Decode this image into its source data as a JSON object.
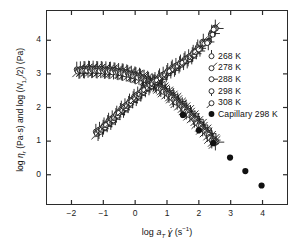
{
  "chart_data": {
    "type": "scatter",
    "title": "",
    "xlabel": "log a_T γ̇ (s⁻¹)",
    "ylabel": "log η_r (Pa·s) and log (N_1,r /2) (Pa)",
    "xlim": [
      -2.8,
      4.8
    ],
    "ylim": [
      -0.9,
      4.9
    ],
    "xticks": [
      -2,
      -1,
      0,
      1,
      2,
      3,
      4
    ],
    "yticks": [
      0,
      1,
      2,
      3,
      4
    ],
    "grid": false,
    "legend_position": "right-inside",
    "legend": [
      {
        "label": "268 K",
        "marker": "circle-tick-up",
        "filled": false
      },
      {
        "label": "278 K",
        "marker": "circle-tick-upright",
        "filled": false
      },
      {
        "label": "288 K",
        "marker": "circle-tick-right",
        "filled": false
      },
      {
        "label": "298 K",
        "marker": "circle-tick-down",
        "filled": false
      },
      {
        "label": "308 K",
        "marker": "circle-tick-downleft",
        "filled": false
      },
      {
        "label": "Capillary 298 K",
        "marker": "filled-circle",
        "filled": true
      }
    ],
    "series": [
      {
        "name": "log η_r (viscosity master curve)",
        "marker": "open-circle-with-tick",
        "points": [
          [
            -1.8,
            3.1
          ],
          [
            -1.72,
            3.11
          ],
          [
            -1.64,
            3.12
          ],
          [
            -1.56,
            3.11
          ],
          [
            -1.48,
            3.13
          ],
          [
            -1.4,
            3.12
          ],
          [
            -1.32,
            3.13
          ],
          [
            -1.24,
            3.12
          ],
          [
            -1.16,
            3.11
          ],
          [
            -1.08,
            3.12
          ],
          [
            -1.0,
            3.1
          ],
          [
            -0.92,
            3.11
          ],
          [
            -0.84,
            3.09
          ],
          [
            -0.76,
            3.1
          ],
          [
            -0.68,
            3.08
          ],
          [
            -0.6,
            3.07
          ],
          [
            -0.52,
            3.06
          ],
          [
            -0.44,
            3.05
          ],
          [
            -0.36,
            3.04
          ],
          [
            -0.28,
            3.02
          ],
          [
            -0.2,
            3.0
          ],
          [
            -0.12,
            2.98
          ],
          [
            -0.04,
            2.96
          ],
          [
            0.04,
            2.94
          ],
          [
            0.12,
            2.92
          ],
          [
            0.2,
            2.89
          ],
          [
            0.28,
            2.86
          ],
          [
            0.36,
            2.83
          ],
          [
            0.44,
            2.79
          ],
          [
            0.52,
            2.75
          ],
          [
            0.6,
            2.71
          ],
          [
            0.68,
            2.66
          ],
          [
            0.76,
            2.61
          ],
          [
            0.84,
            2.56
          ],
          [
            0.92,
            2.5
          ],
          [
            1.0,
            2.44
          ],
          [
            1.08,
            2.38
          ],
          [
            1.16,
            2.32
          ],
          [
            1.24,
            2.25
          ],
          [
            1.32,
            2.18
          ],
          [
            1.4,
            2.11
          ],
          [
            1.48,
            2.04
          ],
          [
            1.56,
            1.97
          ],
          [
            1.64,
            1.89
          ],
          [
            1.72,
            1.81
          ],
          [
            1.8,
            1.73
          ],
          [
            1.88,
            1.65
          ],
          [
            1.96,
            1.56
          ],
          [
            2.04,
            1.48
          ],
          [
            2.12,
            1.39
          ],
          [
            2.2,
            1.31
          ],
          [
            2.28,
            1.22
          ],
          [
            2.36,
            1.12
          ],
          [
            2.44,
            1.03
          ],
          [
            2.52,
            0.97
          ]
        ]
      },
      {
        "name": "log (N_1,r /2) (first normal stress master curve)",
        "marker": "open-circle-with-tick",
        "points": [
          [
            -1.2,
            1.25
          ],
          [
            -1.12,
            1.31
          ],
          [
            -1.04,
            1.37
          ],
          [
            -0.96,
            1.44
          ],
          [
            -0.88,
            1.51
          ],
          [
            -0.8,
            1.58
          ],
          [
            -0.72,
            1.65
          ],
          [
            -0.64,
            1.72
          ],
          [
            -0.56,
            1.79
          ],
          [
            -0.48,
            1.87
          ],
          [
            -0.4,
            1.94
          ],
          [
            -0.32,
            2.01
          ],
          [
            -0.24,
            2.08
          ],
          [
            -0.16,
            2.15
          ],
          [
            -0.08,
            2.22
          ],
          [
            0.0,
            2.29
          ],
          [
            0.08,
            2.36
          ],
          [
            0.16,
            2.42
          ],
          [
            0.24,
            2.49
          ],
          [
            0.32,
            2.55
          ],
          [
            0.4,
            2.61
          ],
          [
            0.48,
            2.67
          ],
          [
            0.56,
            2.73
          ],
          [
            0.64,
            2.79
          ],
          [
            0.72,
            2.84
          ],
          [
            0.8,
            2.9
          ],
          [
            0.88,
            2.95
          ],
          [
            0.96,
            3.0
          ],
          [
            1.04,
            3.06
          ],
          [
            1.12,
            3.11
          ],
          [
            1.2,
            3.16
          ],
          [
            1.28,
            3.21
          ],
          [
            1.36,
            3.26
          ],
          [
            1.44,
            3.31
          ],
          [
            1.52,
            3.36
          ],
          [
            1.6,
            3.41
          ],
          [
            1.68,
            3.47
          ],
          [
            1.76,
            3.53
          ],
          [
            1.84,
            3.6
          ],
          [
            1.92,
            3.68
          ],
          [
            2.0,
            3.76
          ],
          [
            2.14,
            3.93
          ],
          [
            2.28,
            3.95
          ],
          [
            2.42,
            4.2
          ],
          [
            2.5,
            4.35
          ]
        ]
      },
      {
        "name": "Capillary 298 K",
        "marker": "filled-circle",
        "points": [
          [
            1.5,
            1.78
          ],
          [
            2.0,
            1.32
          ],
          [
            2.45,
            0.94
          ],
          [
            2.98,
            0.51
          ],
          [
            3.46,
            0.11
          ],
          [
            3.97,
            -0.32
          ]
        ]
      }
    ]
  },
  "axes": {
    "xticklabels": [
      "-2",
      "-1",
      "0",
      "1",
      "2",
      "3",
      "4"
    ],
    "yticklabels": [
      "0",
      "1",
      "2",
      "3",
      "4"
    ]
  }
}
